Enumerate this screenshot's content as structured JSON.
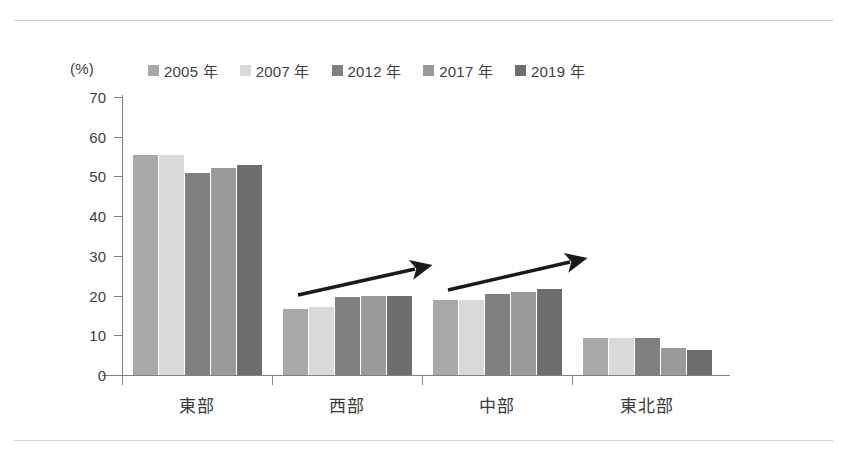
{
  "chart_data": {
    "type": "bar",
    "title": "",
    "subtitle": "",
    "xlabel": "",
    "ylabel": "",
    "unit_label": "(%)",
    "ylim": [
      0,
      70
    ],
    "yticks": [
      0,
      10,
      20,
      30,
      40,
      50,
      60,
      70
    ],
    "ytick_labels": [
      "0",
      "10",
      "20",
      "30",
      "40",
      "50",
      "60",
      "70"
    ],
    "grid": false,
    "legend_position": "top",
    "categories": [
      "東部",
      "西部",
      "中部",
      "東北部"
    ],
    "series": [
      {
        "name": "2005 年",
        "color": "#a8a8a8",
        "values": [
          55.4,
          16.6,
          18.8,
          9.2
        ]
      },
      {
        "name": "2007 年",
        "color": "#d9d9d9",
        "values": [
          55.4,
          17.1,
          18.8,
          9.2
        ]
      },
      {
        "name": "2012 年",
        "color": "#808080",
        "values": [
          50.8,
          19.7,
          20.5,
          9.2
        ]
      },
      {
        "name": "2017 年",
        "color": "#9a9a9a",
        "values": [
          52.2,
          19.9,
          21.0,
          6.8
        ]
      },
      {
        "name": "2019 年",
        "color": "#6e6e6e",
        "values": [
          52.9,
          19.9,
          21.7,
          6.2
        ]
      }
    ],
    "annotations": [
      {
        "name": "trend-arrow-west",
        "over_category": "西部",
        "direction": "up-right",
        "color": "#1a1a1a"
      },
      {
        "name": "trend-arrow-central",
        "over_category": "中部",
        "direction": "up-right",
        "color": "#1a1a1a"
      }
    ]
  }
}
